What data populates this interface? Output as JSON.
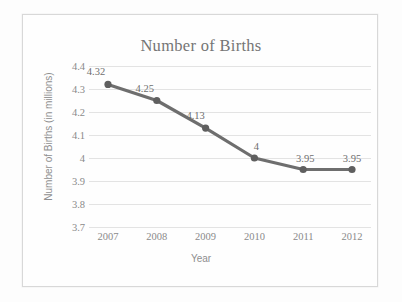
{
  "chart_data": {
    "type": "line",
    "title": "Number of Births",
    "xlabel": "Year",
    "ylabel": "Number of Births (in millions)",
    "categories": [
      "2007",
      "2008",
      "2009",
      "2010",
      "2011",
      "2012"
    ],
    "values": [
      4.32,
      4.25,
      4.13,
      4,
      3.95,
      3.95
    ],
    "point_labels": [
      "4.32",
      "4.25",
      "4.13",
      "4",
      "3.95",
      "3.95"
    ],
    "yticks": [
      "4.4",
      "4.3",
      "4.2",
      "4.1",
      "4",
      "3.9",
      "3.8",
      "3.7"
    ],
    "ytick_values": [
      4.4,
      4.3,
      4.2,
      4.1,
      4.0,
      3.9,
      3.8,
      3.7
    ],
    "ylim": [
      3.7,
      4.4
    ],
    "grid": true,
    "legend": false,
    "series": [
      {
        "name": "Number of Births",
        "values": [
          4.32,
          4.25,
          4.13,
          4,
          3.95,
          3.95
        ]
      }
    ],
    "colors": {
      "line": "#6e6e6e",
      "marker": "#5f5f5f",
      "grid": "#e3e3e3",
      "tick_text": "#8a8a8a",
      "axis_title_text": "#8f8f8f",
      "title_text": "#757575",
      "frame_border": "#d8d8d8",
      "background": "#fefefe"
    }
  }
}
